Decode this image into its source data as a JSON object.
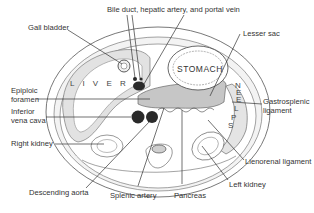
{
  "figure": {
    "organ_labels": {
      "liver": "L I V E R",
      "stomach": "STOMACH",
      "spleen_letters": [
        "S",
        "P",
        "L",
        "E",
        "E",
        "N"
      ]
    },
    "labels": {
      "gall_bladder": "Gall bladder",
      "bile_duct": "Bile duct, hepatic artery, and portal vein",
      "lesser_sac": "Lesser sac",
      "epiploic_foramen_1": "Epiploic",
      "epiploic_foramen_2": "foramen",
      "inferior_vena_cava_1": "Inferior",
      "inferior_vena_cava_2": "vena cava",
      "gastrosplenic_1": "Gastrosplenic",
      "gastrosplenic_2": "ligament",
      "right_kidney": "Right kidney",
      "lienorenal": "Lienorenal ligament",
      "left_kidney": "Left kidney",
      "descending_aorta": "Descending aorta",
      "splenic_artery": "Splenic artery",
      "pancreas": "Pancreas"
    },
    "colors": {
      "shade_light": "#e6e6e6",
      "shade_mid": "#c9c9c9",
      "vessel": "#2a2a2a",
      "line": "#333333"
    }
  }
}
